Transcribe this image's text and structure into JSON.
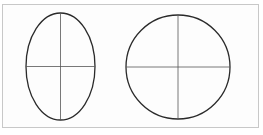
{
  "diagram": {
    "type": "shapes-comparison",
    "stroke_color": "#2a2a2a",
    "axis_color": "#555555",
    "frame_color": "#c8c8c8",
    "shapes": [
      {
        "name": "ellipse",
        "cx": 60.5,
        "cy": 66.5,
        "rx": 34.5,
        "ry": 53.5,
        "axes": [
          "horizontal",
          "vertical"
        ]
      },
      {
        "name": "circle",
        "cx": 178,
        "cy": 67,
        "r": 52,
        "axes": [
          "horizontal",
          "vertical"
        ]
      }
    ]
  }
}
